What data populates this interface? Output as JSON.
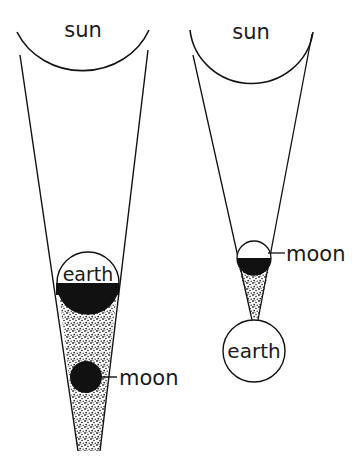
{
  "diagram": {
    "colors": {
      "ink": "#111111",
      "background": "#ffffff",
      "shadow_stipple": "#222222"
    },
    "left_panel": {
      "description": "Lunar eclipse",
      "sun_label": "sun",
      "earth_label": "earth",
      "moon_label": "moon"
    },
    "right_panel": {
      "description": "Solar eclipse",
      "sun_label": "sun",
      "moon_label": "moon",
      "earth_label": "earth"
    }
  }
}
